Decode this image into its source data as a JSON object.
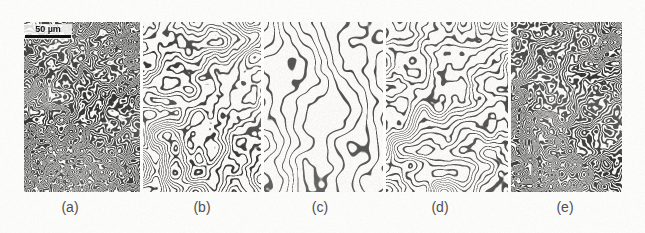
{
  "figure": {
    "kind": "micrograph-panel-series",
    "background_color": "#fdfdfc",
    "ink_color": "#2b2b2b",
    "panel_count": 5
  },
  "scalebar": {
    "label": "50 µm",
    "name": "scale-bar",
    "color": "#0b0b0b",
    "length_px": 46,
    "panel": "a"
  },
  "panels": [
    {
      "id": "a",
      "label": "(a)",
      "label_center_x": 70,
      "x": 24,
      "width": 116,
      "stripe_period_px": 4.2,
      "line_width_px": 1.9,
      "ink_color": "#2f2f2f",
      "density": "very-dense",
      "orientation": "isotropic-labyrinth",
      "seed": 11
    },
    {
      "id": "b",
      "label": "(b)",
      "label_center_x": 202,
      "x": 143,
      "width": 118,
      "stripe_period_px": 8.0,
      "line_width_px": 1.7,
      "ink_color": "#353535",
      "density": "medium",
      "orientation": "isotropic-labyrinth",
      "seed": 23
    },
    {
      "id": "c",
      "label": "(c)",
      "label_center_x": 320,
      "x": 263,
      "width": 119,
      "stripe_period_px": 14.0,
      "line_width_px": 1.6,
      "ink_color": "#3b3b3b",
      "density": "sparse",
      "orientation": "vertically-aligned",
      "seed": 37
    },
    {
      "id": "d",
      "label": "(d)",
      "label_center_x": 440,
      "x": 384,
      "width": 122,
      "stripe_period_px": 9.0,
      "line_width_px": 1.7,
      "ink_color": "#353535",
      "density": "medium",
      "orientation": "isotropic-labyrinth",
      "seed": 53
    },
    {
      "id": "e",
      "label": "(e)",
      "label_center_x": 565,
      "x": 508,
      "width": 114,
      "stripe_period_px": 4.6,
      "line_width_px": 2.0,
      "ink_color": "#2f2f2f",
      "density": "very-dense",
      "orientation": "isotropic-labyrinth",
      "seed": 71
    }
  ],
  "strip": {
    "x": 24,
    "y": 22,
    "width": 598,
    "height": 170,
    "gap_px": 3
  }
}
